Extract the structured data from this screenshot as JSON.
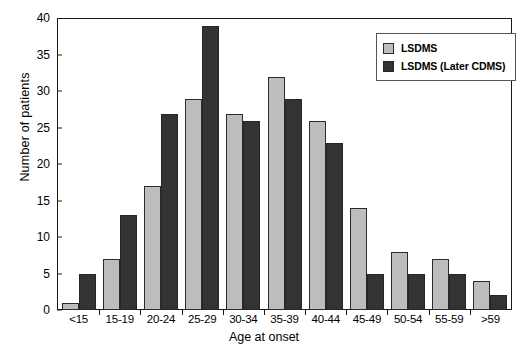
{
  "chart_data": {
    "type": "bar",
    "title": "",
    "xlabel": "Age at onset",
    "ylabel": "Number of patients",
    "ylim": [
      0,
      40
    ],
    "yticks": [
      0,
      5,
      10,
      15,
      20,
      25,
      30,
      35,
      40
    ],
    "grid": false,
    "legend_position": "top-right",
    "categories": [
      "<15",
      "15-19",
      "20-24",
      "25-29",
      "30-34",
      "35-39",
      "40-44",
      "45-49",
      "50-54",
      "55-59",
      ">59"
    ],
    "series": [
      {
        "name": "LSDMS",
        "color": "#bdbdbd",
        "values": [
          1,
          7,
          17,
          29,
          27,
          32,
          26,
          14,
          8,
          7,
          4
        ]
      },
      {
        "name": "LSDMS (Later CDMS)",
        "color": "#333333",
        "values": [
          5,
          13,
          27,
          39,
          26,
          29,
          23,
          5,
          5,
          5,
          2
        ]
      }
    ]
  }
}
